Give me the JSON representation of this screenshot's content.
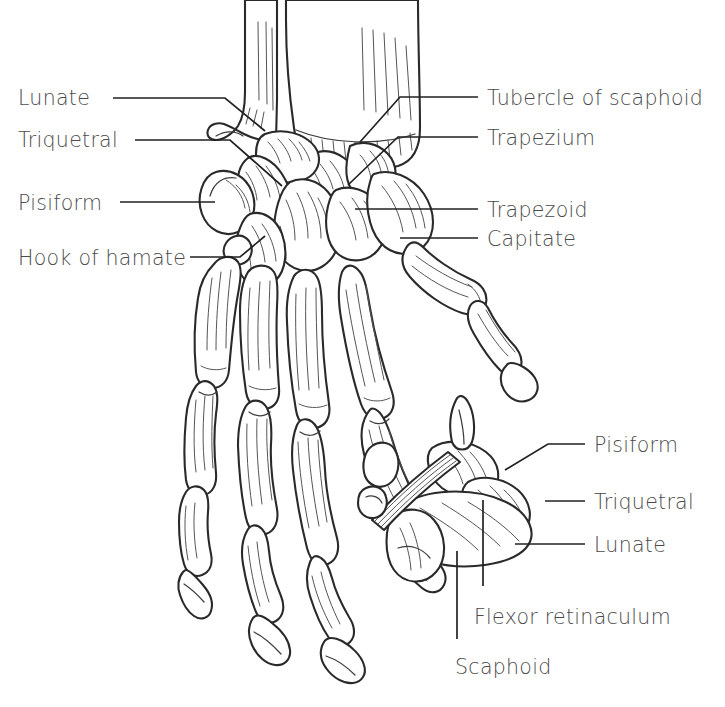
{
  "figure": {
    "line_color": "#2a2a2a",
    "text_color": "#4a4a4a",
    "background_color": "#ffffff",
    "views": [
      {
        "name": "main-palmar-view",
        "description": "Anterior (palmar) view of hand skeleton with carpus"
      },
      {
        "name": "inset-distal-row-view",
        "description": "Oblique view of proximal carpal row with flexor retinaculum"
      }
    ]
  },
  "labels": {
    "left": [
      {
        "id": "lunate-left",
        "text": "Lunate",
        "x": 18,
        "y": 88
      },
      {
        "id": "triquetral-left",
        "text": "Triquetral",
        "x": 18,
        "y": 130
      },
      {
        "id": "pisiform-left",
        "text": "Pisiform",
        "x": 18,
        "y": 193
      },
      {
        "id": "hook-of-hamate",
        "text": "Hook of hamate",
        "x": 18,
        "y": 248
      }
    ],
    "right_top": [
      {
        "id": "tubercle-of-scaphoid",
        "text": "Tubercle of scaphoid",
        "x": 487,
        "y": 88
      },
      {
        "id": "trapezium",
        "text": "Trapezium",
        "x": 487,
        "y": 128
      },
      {
        "id": "trapezoid",
        "text": "Trapezoid",
        "x": 487,
        "y": 200
      },
      {
        "id": "capitate",
        "text": "Capitate",
        "x": 487,
        "y": 229
      }
    ],
    "right_bottom": [
      {
        "id": "pisiform-inset",
        "text": "Pisiform",
        "x": 594,
        "y": 435
      },
      {
        "id": "triquetral-inset",
        "text": "Triquetral",
        "x": 594,
        "y": 492
      },
      {
        "id": "lunate-inset",
        "text": "Lunate",
        "x": 594,
        "y": 535
      }
    ],
    "bottom": [
      {
        "id": "flexor-retinaculum",
        "text": "Flexor retinaculum",
        "x": 474,
        "y": 607
      },
      {
        "id": "scaphoid",
        "text": "Scaphoid",
        "x": 455,
        "y": 657
      }
    ]
  },
  "leader_lines": [
    {
      "id": "leader-lunate-left",
      "points": "113,98 225,98 265,131"
    },
    {
      "id": "leader-triquetral-left",
      "points": "135,140 230,140 282,186"
    },
    {
      "id": "leader-pisiform-left",
      "points": "120,202 215,202"
    },
    {
      "id": "leader-hook-of-hamate",
      "points": "190,257 240,257 265,236"
    },
    {
      "id": "leader-tubercle-of-scaphoid",
      "points": "478,97 400,97 360,142"
    },
    {
      "id": "leader-trapezium",
      "points": "478,137 398,137 348,185"
    },
    {
      "id": "leader-trapezoid",
      "points": "478,209 355,209"
    },
    {
      "id": "leader-capitate",
      "points": "478,238 400,238"
    },
    {
      "id": "leader-pisiform-inset",
      "points": "585,444 548,444 505,470"
    },
    {
      "id": "leader-triquetral-inset",
      "points": "585,501 545,501"
    },
    {
      "id": "leader-lunate-inset",
      "points": "585,544 515,544"
    },
    {
      "id": "leader-flexor-retinaculum",
      "points": "483,586 483,500"
    },
    {
      "id": "leader-scaphoid",
      "points": "457,639 457,551"
    }
  ]
}
